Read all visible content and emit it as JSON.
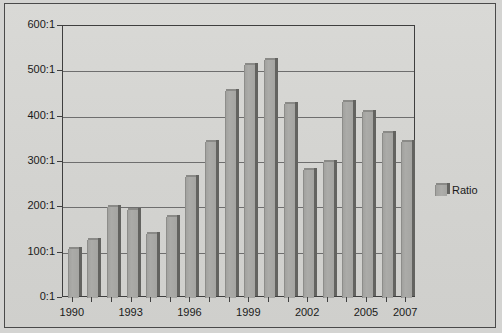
{
  "chart_data": {
    "type": "bar",
    "title": "",
    "xlabel": "",
    "ylabel": "",
    "legend_position": "right",
    "grid": true,
    "ylim": [
      0,
      600
    ],
    "ytick_labels": [
      "600:1",
      "500:1",
      "400:1",
      "300:1",
      "200:1",
      "100:1",
      "0:1"
    ],
    "ytick_values": [
      600,
      500,
      400,
      300,
      200,
      100,
      0
    ],
    "categories": [
      "1990",
      "1991",
      "1992",
      "1993",
      "1994",
      "1995",
      "1996",
      "1997",
      "1998",
      "1999",
      "2000",
      "2001",
      "2002",
      "2003",
      "2004",
      "2005",
      "2006",
      "2007"
    ],
    "xtick_labels_shown": [
      "1990",
      "1993",
      "1996",
      "1999",
      "2002",
      "2005",
      "2007"
    ],
    "series": [
      {
        "name": "Ratio",
        "color": "#a8a8a5",
        "values": [
          107,
          128,
          200,
          195,
          142,
          178,
          267,
          345,
          457,
          515,
          525,
          428,
          282,
          300,
          432,
          410,
          365,
          344
        ]
      }
    ]
  },
  "legend": {
    "entries": [
      {
        "label": "Ratio"
      }
    ]
  }
}
